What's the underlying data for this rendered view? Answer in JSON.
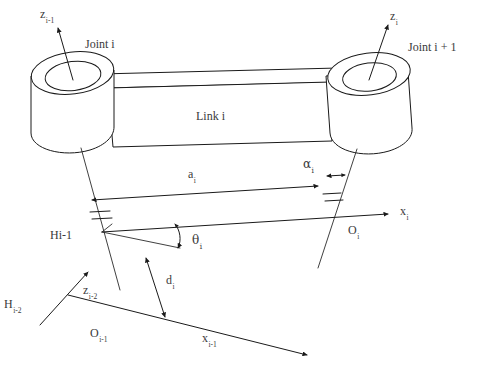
{
  "figure": {
    "type": "diagram",
    "width": 483,
    "height": 377,
    "background_color": "#ffffff",
    "line_color": "#1a1a1a",
    "text_color": "#3a3a3a"
  },
  "labels": {
    "z_prev": {
      "base": "z",
      "sub": "i-1"
    },
    "z_curr": {
      "base": "z",
      "sub": "i"
    },
    "z_prev2": {
      "base": "z",
      "sub": "i-2"
    },
    "joint_i": "Joint i",
    "joint_i_plus_1": "Joint i + 1",
    "link_i": "Link i",
    "a_i": {
      "base": "a",
      "sub": "i"
    },
    "alpha_i": {
      "base": "α",
      "sub": "i"
    },
    "theta_i": {
      "base": "θ",
      "sub": "i"
    },
    "d_i": {
      "base": "d",
      "sub": "i"
    },
    "H_prev": {
      "base": "Hi-1",
      "sub": ""
    },
    "H_prev2": {
      "base": "H",
      "sub": "i-2"
    },
    "O_prev": {
      "base": "O",
      "sub": "i-1"
    },
    "O_curr": {
      "base": "O",
      "sub": "i"
    },
    "x_prev": {
      "base": "x",
      "sub": "i-1"
    },
    "x_curr": {
      "base": "x",
      "sub": "i"
    }
  },
  "elements": {
    "left_joint_cylinder": "joint-i-cylinder",
    "right_joint_cylinder": "joint-i-plus-1-cylinder",
    "link_body": "link-i-body",
    "left_joint_axis": "z-axis-i-minus-1",
    "right_joint_axis": "z-axis-i",
    "a_dimension_arrow": "link-length-a-i",
    "alpha_dimension_arrow": "link-twist-alpha-i",
    "d_dimension_arrow": "link-offset-d-i",
    "theta_angle_arc": "joint-angle-theta-i",
    "perp_ticks_left": "perpendicular-tick-marks-left",
    "perp_ticks_right": "perpendicular-tick-marks-right"
  }
}
